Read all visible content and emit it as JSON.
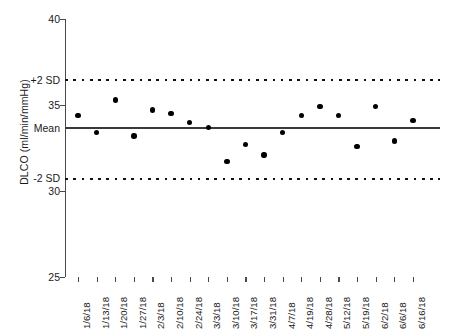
{
  "chart_data": {
    "type": "scatter",
    "title": "",
    "xlabel": "",
    "ylabel": "DLCO (ml/min/mmHg)",
    "ylim": [
      25,
      40
    ],
    "yticks": [
      25,
      30,
      35,
      40
    ],
    "ytick_labels": [
      "25",
      "30",
      "35",
      "40"
    ],
    "grid": false,
    "legend": null,
    "series_name": "DLCO",
    "categories": [
      "1/6/18",
      "1/13/18",
      "1/20/18",
      "1/27/18",
      "2/3/18",
      "2/10/18",
      "2/24/18",
      "3/3/18",
      "3/10/18",
      "3/17/18",
      "3/31/18",
      "4/7/18",
      "4/19/18",
      "4/28/18",
      "5/12/18",
      "5/19/18",
      "6/2/18",
      "6/6/18",
      "6/16/18"
    ],
    "values": [
      34.4,
      33.4,
      35.3,
      33.2,
      34.7,
      34.5,
      34.0,
      33.7,
      31.7,
      32.7,
      32.1,
      33.4,
      34.4,
      34.9,
      34.4,
      32.6,
      34.9,
      32.9,
      34.1
    ],
    "reference_lines": [
      {
        "name": "plus-2-sd",
        "label": "+2 SD",
        "value": 36.45,
        "style": "dotted"
      },
      {
        "name": "mean",
        "label": "Mean",
        "value": 33.65,
        "style": "solid"
      },
      {
        "name": "minus-2-sd",
        "label": "-2 SD",
        "value": 30.7,
        "style": "dotted"
      }
    ],
    "colors": {
      "point": "#000000",
      "mean_line": "#3a3a3a",
      "sd_line": "#111111",
      "axis": "#4a4a4a",
      "text": "#1a1a1a",
      "background": "#ffffff"
    }
  }
}
